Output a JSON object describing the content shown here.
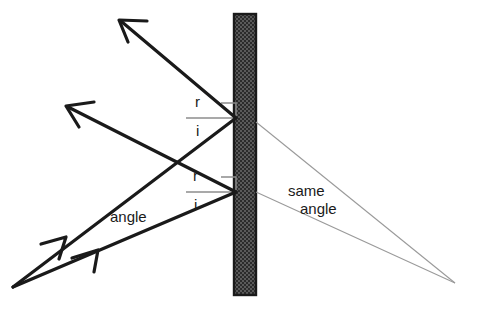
{
  "diagram": {
    "canvas": {
      "width": 477,
      "height": 309,
      "background": "#ffffff"
    },
    "colors": {
      "ray_stroke": "#1a1a1a",
      "virtual_ray_stroke": "#9a9a9a",
      "mirror_border": "#1a1a1a",
      "mirror_fill": "#4a4a4a",
      "normal_line": "#8c8c8c",
      "text": "#1a1a1a"
    },
    "labels": {
      "reflected_upper": "r",
      "incident_upper": "i",
      "reflected_lower": "r",
      "incident_lower": "i",
      "angle": "angle",
      "same_angle_line1": "same",
      "same_angle_line2": "angle"
    },
    "mirror": {
      "name": "mirror-surface",
      "x": 234,
      "y": 14,
      "width": 22,
      "height": 281,
      "hatch": "dotted-checker"
    },
    "points": {
      "source": {
        "x": 13,
        "y": 287
      },
      "reflection_upper": {
        "x": 236,
        "y": 118
      },
      "reflection_lower": {
        "x": 236,
        "y": 192
      },
      "virtual_image": {
        "x": 455,
        "y": 283
      },
      "arrow_tip_upper": {
        "x": 120,
        "y": 20
      },
      "arrow_tip_lower": {
        "x": 66,
        "y": 105
      }
    },
    "rays": [
      {
        "name": "incident-ray-upper",
        "from": {
          "x": 13,
          "y": 287
        },
        "to": {
          "x": 236,
          "y": 118
        },
        "kind": "solid",
        "arrow": "mid"
      },
      {
        "name": "incident-ray-lower",
        "from": {
          "x": 13,
          "y": 287
        },
        "to": {
          "x": 236,
          "y": 192
        },
        "kind": "solid",
        "arrow": "mid"
      },
      {
        "name": "reflected-ray-upper",
        "from": {
          "x": 236,
          "y": 118
        },
        "to": {
          "x": 120,
          "y": 20
        },
        "kind": "solid",
        "arrow": "end"
      },
      {
        "name": "reflected-ray-lower",
        "from": {
          "x": 236,
          "y": 192
        },
        "to": {
          "x": 66,
          "y": 105
        },
        "kind": "solid",
        "arrow": "end"
      },
      {
        "name": "virtual-ray-upper",
        "from": {
          "x": 256,
          "y": 122
        },
        "to": {
          "x": 455,
          "y": 283
        },
        "kind": "thin"
      },
      {
        "name": "virtual-ray-lower",
        "from": {
          "x": 256,
          "y": 192
        },
        "to": {
          "x": 455,
          "y": 283
        },
        "kind": "thin"
      }
    ],
    "normals": [
      {
        "name": "normal-line-upper",
        "x1": 186,
        "y1": 118,
        "x2": 236,
        "y2": 118
      },
      {
        "name": "normal-line-lower",
        "x1": 186,
        "y1": 192,
        "x2": 236,
        "y2": 192
      }
    ],
    "right_angle_markers": [
      {
        "name": "right-angle-marker-upper",
        "x": 221,
        "y": 103,
        "size": 15
      },
      {
        "name": "right-angle-marker-lower",
        "x": 221,
        "y": 177,
        "size": 15
      }
    ],
    "label_positions": {
      "reflected_upper": {
        "x": 195,
        "y": 107
      },
      "incident_upper": {
        "x": 195,
        "y": 136
      },
      "reflected_lower": {
        "x": 193,
        "y": 181
      },
      "incident_lower": {
        "x": 193,
        "y": 210
      },
      "angle": {
        "x": 110,
        "y": 222
      },
      "same_angle_line1": {
        "x": 288,
        "y": 195
      },
      "same_angle_line2": {
        "x": 300,
        "y": 213
      }
    }
  }
}
